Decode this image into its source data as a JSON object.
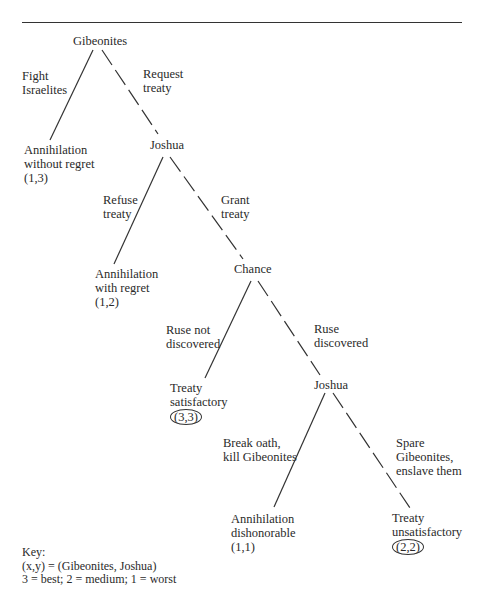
{
  "nodes": {
    "root": "Gibeonites",
    "joshua1": "Joshua",
    "chance": "Chance",
    "joshua2": "Joshua"
  },
  "edges": {
    "fight": [
      "Fight",
      "Israelites"
    ],
    "request": [
      "Request",
      "treaty"
    ],
    "refuse": [
      "Refuse",
      "treaty"
    ],
    "grant": [
      "Grant",
      "treaty"
    ],
    "ruse_not": [
      "Ruse not",
      "discovered"
    ],
    "ruse_disc": [
      "Ruse",
      "discovered"
    ],
    "break": [
      "Break oath,",
      "kill Gibeonites"
    ],
    "spare": [
      "Spare",
      "Gibeonites,",
      "enslave them"
    ]
  },
  "outcomes": {
    "o1": {
      "lines": [
        "Annihilation",
        "without regret"
      ],
      "payoff": "(1,3)",
      "circled": false
    },
    "o2": {
      "lines": [
        "Annihilation",
        "with regret"
      ],
      "payoff": "(1,2)",
      "circled": false
    },
    "o3": {
      "lines": [
        "Treaty",
        "satisfactory"
      ],
      "payoff": "(3,3)",
      "circled": true
    },
    "o4": {
      "lines": [
        "Annihilation",
        "dishonorable"
      ],
      "payoff": "(1,1)",
      "circled": false
    },
    "o5": {
      "lines": [
        "Treaty",
        "unsatisfactory"
      ],
      "payoff": "(2,2)",
      "circled": true
    }
  },
  "key": {
    "title": "Key:",
    "line1": "(x,y) = (Gibeonites, Joshua)",
    "line2": "3 = best; 2 = medium; 1 = worst"
  },
  "line_style": {
    "solid": "non-equilibrium choice",
    "dashed": "equilibrium path",
    "color": "#333333"
  }
}
